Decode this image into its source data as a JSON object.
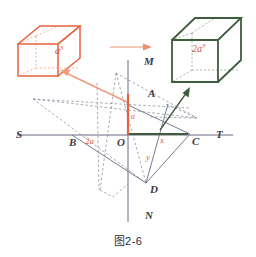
{
  "figure": {
    "caption": "图2-6",
    "colors": {
      "orange": "#e8613c",
      "orange_light": "#ef9a7d",
      "green": "#3f5c3f",
      "axis": "#6b6b84",
      "dash": "#6b6b84",
      "label_dark": "#3b3b4a",
      "label_red": "#e8613c",
      "background": "#ffffff"
    },
    "cubes": {
      "left": {
        "name": "unit-cube",
        "label": "a",
        "exponent": "3",
        "color": "#e8613c"
      },
      "right": {
        "name": "double-cube",
        "label": "2a",
        "exponent": "3",
        "color": "#3f5c3f",
        "label_color": "#d4503a"
      }
    },
    "axes": {
      "horizontal": {
        "left_label": "S",
        "right_label": "T"
      },
      "vertical": {
        "top_label": "M",
        "bottom_label": "N"
      },
      "origin_label": "O"
    },
    "points": [
      {
        "name": "point-A",
        "label": "A"
      },
      {
        "name": "point-B",
        "label": "B"
      },
      {
        "name": "point-C",
        "label": "C"
      },
      {
        "name": "point-D",
        "label": "D"
      },
      {
        "name": "point-O",
        "label": "O"
      },
      {
        "name": "point-M",
        "label": "M"
      },
      {
        "name": "point-N",
        "label": "N"
      },
      {
        "name": "point-S",
        "label": "S"
      },
      {
        "name": "point-T",
        "label": "T"
      }
    ],
    "measure_labels": [
      {
        "name": "segment-length-a",
        "text": "a",
        "color": "#e8613c"
      },
      {
        "name": "segment-length-2a",
        "text": "2a",
        "color": "#e8613c"
      },
      {
        "name": "segment-length-x",
        "text": "x",
        "color": "#e8613c"
      },
      {
        "name": "segment-length-y",
        "text": "y",
        "color": "#e8613c"
      }
    ],
    "arrows": {
      "transform_arrow": {
        "name": "transform-arrow",
        "color": "#e8956f"
      },
      "to_left_cube": {
        "name": "callout-arrow-left-cube",
        "color": "#ef9a7d"
      },
      "to_right_cube": {
        "name": "callout-arrow-right-cube",
        "color": "#3f5c3f"
      }
    }
  }
}
